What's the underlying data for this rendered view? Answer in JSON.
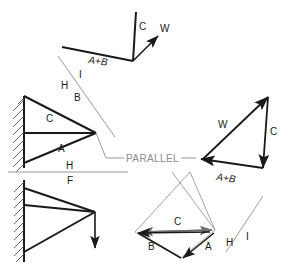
{
  "diagram": {
    "colors": {
      "member_line": "#1a1a1a",
      "construction_line": "#9a9a9a",
      "fold_line": "#9a9a9a",
      "force_c": "#6e6e6e",
      "background": "#ffffff",
      "text": "#1a1a1a",
      "text_gray": "#8c8c8c"
    },
    "annotations": {
      "parallel": "PARALLEL",
      "fold_h_top": "H",
      "fold_f": "F",
      "fold_h_upper": "H",
      "fold_i_upper": "I",
      "fold_h_lower": "H",
      "fold_i_lower": "I"
    },
    "views": [
      {
        "name": "auxiliary-vector-view",
        "position": "top-right",
        "labels": [
          {
            "id": "c",
            "text": "C"
          },
          {
            "id": "w",
            "text": "W"
          },
          {
            "id": "ab",
            "text": "A+B"
          }
        ]
      },
      {
        "name": "horizontal-view-bracket",
        "position": "upper-left",
        "labels": [
          {
            "id": "b",
            "text": "B"
          },
          {
            "id": "c",
            "text": "C"
          },
          {
            "id": "a",
            "text": "A"
          }
        ]
      },
      {
        "name": "frontal-view-bracket",
        "position": "lower-left",
        "labels": []
      },
      {
        "name": "force-polygon-triangle",
        "position": "right",
        "labels": [
          {
            "id": "w",
            "text": "W"
          },
          {
            "id": "c",
            "text": "C"
          },
          {
            "id": "ab",
            "text": "A+B"
          }
        ]
      },
      {
        "name": "force-polygon-bottom",
        "position": "bottom-right",
        "labels": [
          {
            "id": "c",
            "text": "C"
          },
          {
            "id": "b",
            "text": "B"
          },
          {
            "id": "a",
            "text": "A"
          }
        ]
      }
    ]
  }
}
